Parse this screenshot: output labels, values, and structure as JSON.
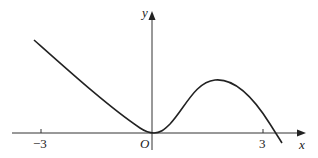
{
  "figure": {
    "axes": {
      "x_label": "x",
      "y_label": "y",
      "origin_label": "O",
      "x_ticks": [
        {
          "value": -3,
          "label": "−3"
        },
        {
          "value": 3,
          "label": "3"
        }
      ]
    },
    "curve": {
      "description": "graph of a function with a local minimum touching the origin, a local maximum near x = 1.7, and decreasing past x ≈ 3.3",
      "color": "#222222"
    }
  }
}
